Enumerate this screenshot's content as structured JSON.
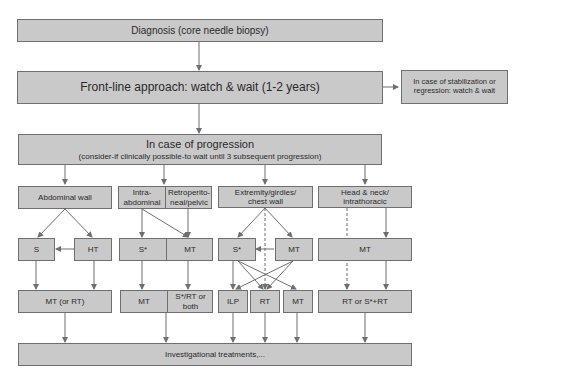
{
  "nodes": {
    "diagnosis": "Diagnosis (core needle biopsy)",
    "frontline": "Front-line approach: watch & wait (1-2 years)",
    "stabilization": "In case of stabilization or regression: watch & wait",
    "progression_title": "In case of progression",
    "progression_sub": "(consider-if clinically possible-to wait until 3 subsequent progression)",
    "abdominal_wall": "Abdominal wall",
    "intra_abdominal": "Intra-abdominal",
    "retroperitoneal": "Retroperito-neal/pelvic",
    "extremity": "Extremity/girdles/ chest wall",
    "head_neck": "Head & neck/ intrathoracic",
    "aw_s": "S",
    "aw_ht": "HT",
    "ia_s": "S*",
    "ia_mt": "MT",
    "ex_s": "S*",
    "ex_mt": "MT",
    "hn_mt": "MT",
    "aw_out": "MT (or RT)",
    "ia_out_mt": "MT",
    "ia_out_srt": "S*/RT or both",
    "ex_ilp": "ILP",
    "ex_rt": "RT",
    "ex_mt_out": "MT",
    "hn_out": "RT or S*+RT",
    "investigational": "Investigational treatments,..."
  },
  "colors": {
    "box_fill": "#c9c9c9",
    "box_border": "#6f6f6f",
    "line": "#6f6f6f"
  }
}
